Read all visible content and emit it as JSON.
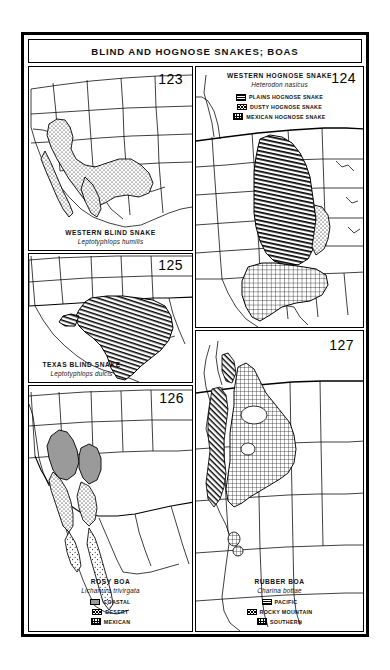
{
  "plate": {
    "title": "BLIND AND HOGNOSE SNAKES;  BOAS"
  },
  "panels": [
    {
      "id": "western-blind-snake",
      "page_number": "123",
      "common_name": "WESTERN BLIND SNAKE",
      "scientific_name": "Leptotyphlops humilis",
      "legend": []
    },
    {
      "id": "western-hognose-snake",
      "page_number": "124",
      "common_name": "WESTERN HOGNOSE SNAKE",
      "scientific_name": "Heterodon nasicus",
      "legend": [
        {
          "label": "PLAINS HOGNOSE SNAKE",
          "pattern": "hatch"
        },
        {
          "label": "DUSTY HOGNOSE SNAKE",
          "pattern": "stipple"
        },
        {
          "label": "MEXICAN HOGNOSE SNAKE",
          "pattern": "grid"
        }
      ]
    },
    {
      "id": "texas-blind-snake",
      "page_number": "125",
      "common_name": "TEXAS BLIND SNAKE",
      "scientific_name": "Leptotyphlops dulcis",
      "legend": []
    },
    {
      "id": "rosy-boa",
      "page_number": "126",
      "common_name": "ROSY BOA",
      "scientific_name": "Lichanura trivirgata",
      "legend": [
        {
          "label": "COASTAL",
          "pattern": "solid"
        },
        {
          "label": "DESERT",
          "pattern": "stipple"
        },
        {
          "label": "MEXICAN",
          "pattern": "grid"
        }
      ]
    },
    {
      "id": "rubber-boa",
      "page_number": "127",
      "common_name": "RUBBER BOA",
      "scientific_name": "Charina bottae",
      "legend": [
        {
          "label": "PACIFIC",
          "pattern": "hatch"
        },
        {
          "label": "ROCKY MOUNTAIN",
          "pattern": "stipple"
        },
        {
          "label": "SOUTHERN",
          "pattern": "grid"
        }
      ]
    }
  ],
  "colors": {
    "ink": "#000000",
    "paper": "#ffffff",
    "range_solid": "#9a9a9a"
  }
}
